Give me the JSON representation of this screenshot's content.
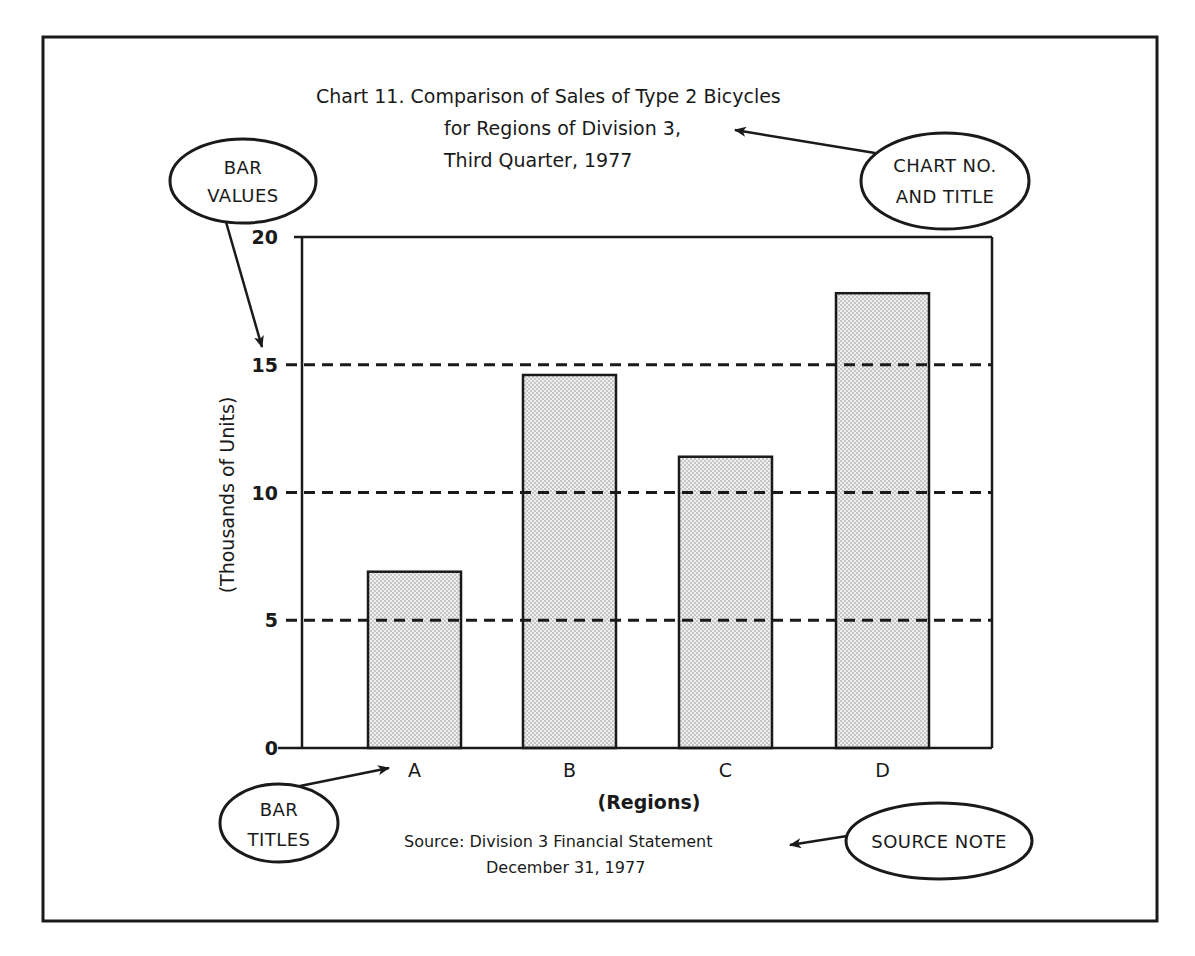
{
  "chart_data": {
    "type": "bar",
    "title_lines": [
      "Chart  11.  Comparison of Sales of Type 2 Bicycles",
      "for Regions of Division 3,",
      "Third Quarter, 1977"
    ],
    "title": "Chart 11. Comparison of Sales of Type 2 Bicycles for Regions of Division 3, Third Quarter, 1977",
    "categories": [
      "A",
      "B",
      "C",
      "D"
    ],
    "values": [
      6.9,
      14.6,
      11.4,
      17.8
    ],
    "xlabel": "(Regions)",
    "ylabel": "(Thousands of Units)",
    "ylim": [
      0,
      20
    ],
    "yticks": [
      0,
      5,
      10,
      15,
      20
    ],
    "grid": {
      "on": true,
      "style": "dashed",
      "lines_at": [
        5,
        10,
        15
      ]
    },
    "legend": null,
    "bar_fill": "stippled light gray",
    "source_lines": [
      "Source:  Division 3 Financial Statement",
      "December 31, 1977"
    ],
    "annotations": [
      {
        "id": "bar-values",
        "lines": [
          "BAR",
          "VALUES"
        ],
        "points_to": "y-axis tick labels"
      },
      {
        "id": "chart-no-title",
        "lines": [
          "CHART NO.",
          "AND TITLE"
        ],
        "points_to": "chart title"
      },
      {
        "id": "bar-titles",
        "lines": [
          "BAR",
          "TITLES"
        ],
        "points_to": "category labels"
      },
      {
        "id": "source-note",
        "lines": [
          "SOURCE NOTE"
        ],
        "points_to": "source line"
      }
    ]
  },
  "colors": {
    "ink": "#1a1a1a",
    "paper": "#ffffff",
    "bar_fill": "#ececec",
    "stipple_dot": "#8a8a8a"
  }
}
